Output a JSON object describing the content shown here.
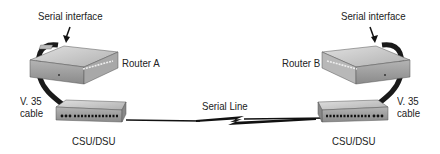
{
  "diagram": {
    "left": {
      "serial_interface_label": "Serial interface",
      "router_label": "Router A",
      "cable_label_line1": "V. 35",
      "cable_label_line2": "cable",
      "csu_label": "CSU/DSU"
    },
    "right": {
      "serial_interface_label": "Serial interface",
      "router_label": "Router B",
      "cable_label_line1": "V. 35",
      "cable_label_line2": "cable",
      "csu_label": "CSU/DSU"
    },
    "link_label": "Serial Line"
  },
  "colors": {
    "device_top": "#c8c8c8",
    "device_front": "#9a9a9a",
    "device_side": "#7a7a7a",
    "cable": "#1a1a1a",
    "text": "#222222"
  }
}
